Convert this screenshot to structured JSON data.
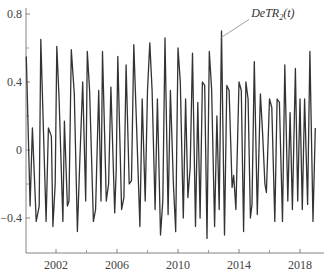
{
  "chart_data": {
    "type": "line",
    "title": "",
    "xlabel": "",
    "ylabel": "",
    "xlim": [
      2000.0,
      2019.6
    ],
    "ylim": [
      -0.6,
      0.82
    ],
    "xticks": [
      2002,
      2006,
      2010,
      2014,
      2018
    ],
    "xminor_ticks": [
      2004,
      2008,
      2012,
      2016
    ],
    "yticks": [
      0.8,
      0.4,
      0,
      -0.4
    ],
    "ytick_labels": [
      "0.8",
      "0.4",
      "0",
      "−0.4"
    ],
    "yminor_ticks": [
      0.6,
      0.2,
      -0.2
    ],
    "xtick_labels": [
      "2002",
      "2006",
      "2010",
      "2014",
      "2018"
    ],
    "grid": false,
    "legend": "none",
    "annotation": {
      "text": "DeTR",
      "subscript": "2",
      "suffix": "(t)",
      "x": 2012.8,
      "y": 0.66,
      "label_x": 2014.8,
      "label_y": 0.78
    },
    "series": [
      {
        "name": "DeTR2(t)",
        "color": "#333333",
        "points": [
          [
            2000.05,
            0.55
          ],
          [
            2000.3,
            -0.33
          ],
          [
            2000.45,
            0.13
          ],
          [
            2000.7,
            -0.42
          ],
          [
            2000.9,
            -0.33
          ],
          [
            2001.0,
            0.65
          ],
          [
            2001.35,
            -0.42
          ],
          [
            2001.5,
            0.13
          ],
          [
            2001.7,
            0.08
          ],
          [
            2001.8,
            -0.45
          ],
          [
            2001.95,
            -0.2
          ],
          [
            2002.05,
            0.61
          ],
          [
            2002.2,
            0.3
          ],
          [
            2002.45,
            -0.42
          ],
          [
            2002.55,
            0.17
          ],
          [
            2002.75,
            -0.33
          ],
          [
            2002.85,
            -0.3
          ],
          [
            2003.0,
            0.59
          ],
          [
            2003.2,
            0.33
          ],
          [
            2003.4,
            -0.48
          ],
          [
            2003.55,
            -0.1
          ],
          [
            2003.75,
            0.4
          ],
          [
            2003.95,
            -0.3
          ],
          [
            2004.05,
            0.58
          ],
          [
            2004.2,
            0.35
          ],
          [
            2004.45,
            -0.42
          ],
          [
            2004.6,
            -0.35
          ],
          [
            2004.8,
            0.35
          ],
          [
            2004.95,
            -0.3
          ],
          [
            2005.05,
            0.58
          ],
          [
            2005.3,
            -0.3
          ],
          [
            2005.45,
            -0.2
          ],
          [
            2005.6,
            0.37
          ],
          [
            2005.85,
            -0.37
          ],
          [
            2005.95,
            -0.12
          ],
          [
            2006.05,
            0.55
          ],
          [
            2006.3,
            -0.35
          ],
          [
            2006.45,
            -0.28
          ],
          [
            2006.6,
            0.5
          ],
          [
            2006.8,
            -0.2
          ],
          [
            2006.95,
            -0.18
          ],
          [
            2007.1,
            0.62
          ],
          [
            2007.3,
            0.1
          ],
          [
            2007.5,
            -0.45
          ],
          [
            2007.65,
            0.3
          ],
          [
            2007.85,
            -0.3
          ],
          [
            2008.0,
            0.35
          ],
          [
            2008.15,
            0.63
          ],
          [
            2008.3,
            0.35
          ],
          [
            2008.5,
            -0.35
          ],
          [
            2008.65,
            0.3
          ],
          [
            2008.85,
            -0.5
          ],
          [
            2009.0,
            -0.3
          ],
          [
            2009.15,
            0.66
          ],
          [
            2009.35,
            -0.38
          ],
          [
            2009.5,
            0.35
          ],
          [
            2009.7,
            -0.2
          ],
          [
            2009.85,
            -0.48
          ],
          [
            2010.0,
            0.6
          ],
          [
            2010.15,
            0.4
          ],
          [
            2010.35,
            -0.4
          ],
          [
            2010.5,
            0.3
          ],
          [
            2010.65,
            -0.28
          ],
          [
            2010.8,
            -0.1
          ],
          [
            2010.95,
            0.57
          ],
          [
            2011.15,
            -0.45
          ],
          [
            2011.3,
            0.28
          ],
          [
            2011.45,
            -0.4
          ],
          [
            2011.6,
            0.4
          ],
          [
            2011.75,
            0.38
          ],
          [
            2011.9,
            -0.52
          ],
          [
            2012.05,
            0.58
          ],
          [
            2012.2,
            0.36
          ],
          [
            2012.4,
            -0.45
          ],
          [
            2012.55,
            0.2
          ],
          [
            2012.7,
            -0.35
          ],
          [
            2012.85,
            0.7
          ],
          [
            2013.05,
            -0.5
          ],
          [
            2013.2,
            0.38
          ],
          [
            2013.35,
            0.35
          ],
          [
            2013.55,
            -0.22
          ],
          [
            2013.65,
            -0.15
          ],
          [
            2013.8,
            -0.35
          ],
          [
            2014.0,
            0.4
          ],
          [
            2014.15,
            0.35
          ],
          [
            2014.3,
            -0.48
          ],
          [
            2014.45,
            0.4
          ],
          [
            2014.6,
            0.3
          ],
          [
            2014.75,
            -0.4
          ],
          [
            2014.85,
            -0.32
          ],
          [
            2015.0,
            0.52
          ],
          [
            2015.2,
            -0.38
          ],
          [
            2015.4,
            0.33
          ],
          [
            2015.55,
            0.1
          ],
          [
            2015.7,
            -0.2
          ],
          [
            2015.8,
            -0.25
          ],
          [
            2016.0,
            0.3
          ],
          [
            2016.15,
            0.25
          ],
          [
            2016.35,
            -0.42
          ],
          [
            2016.5,
            0.3
          ],
          [
            2016.65,
            0.28
          ],
          [
            2016.85,
            -0.42
          ],
          [
            2017.0,
            0.5
          ],
          [
            2017.2,
            -0.3
          ],
          [
            2017.35,
            0.22
          ],
          [
            2017.5,
            -0.35
          ],
          [
            2017.7,
            0.48
          ],
          [
            2017.85,
            -0.3
          ],
          [
            2018.0,
            0.3
          ],
          [
            2018.15,
            -0.35
          ],
          [
            2018.3,
            0.3
          ],
          [
            2018.5,
            -0.32
          ],
          [
            2018.65,
            0.58
          ],
          [
            2018.85,
            -0.42
          ],
          [
            2019.0,
            0.13
          ]
        ]
      }
    ]
  }
}
